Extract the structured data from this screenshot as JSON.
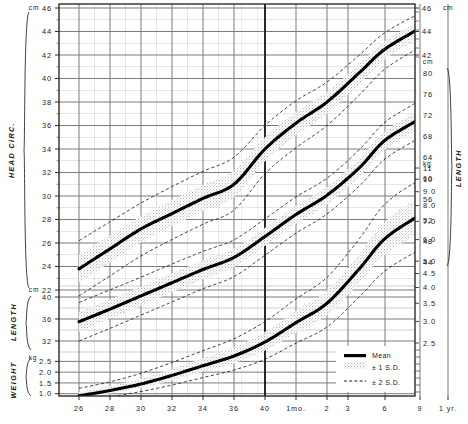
{
  "chart_data": {
    "type": "line",
    "title": "",
    "xlabel": "",
    "ylabel": "",
    "grid": true,
    "legend_position": "bottom-right",
    "x_axis": {
      "name": "gestational-and-postnatal-age",
      "tick_labels": [
        "26",
        "28",
        "30",
        "32",
        "34",
        "36",
        "40",
        "1mo.",
        "2",
        "3",
        "6",
        "9",
        "1 yr."
      ],
      "tick_x": [
        79,
        110,
        141,
        172,
        203,
        234,
        265,
        296,
        327,
        348,
        385,
        420,
        448
      ],
      "birth_divider_x": 190
    },
    "panels": [
      {
        "name": "head-circumference",
        "axis_title": "HEAD CIRC.",
        "unit_left": "cm",
        "unit_right": "cm",
        "left_ticks": [
          "46",
          "44",
          "42",
          "40",
          "38",
          "36",
          "34",
          "32",
          "30",
          "28",
          "26",
          "24",
          "22"
        ],
        "left_tick_values": [
          46,
          44,
          42,
          40,
          38,
          36,
          34,
          32,
          30,
          28,
          26,
          24,
          22
        ],
        "right_ticks": [
          "46",
          "44",
          "42"
        ],
        "right_tick_values": [
          46,
          44,
          42
        ],
        "ylim": [
          22,
          46
        ],
        "mean_label": "Mean",
        "series": [
          {
            "name": "mean",
            "x": [
              26,
              28,
              30,
              32,
              34,
              36,
              40,
              44,
              48,
              56,
              65,
              74,
              82
            ],
            "values": [
              23.8,
              25.5,
              27.2,
              28.5,
              29.8,
              31.0,
              34.0,
              36.2,
              38.0,
              40.5,
              42.5,
              44.3,
              45.9
            ]
          },
          {
            "name": "plus2sd",
            "x": [
              26,
              28,
              30,
              32,
              34,
              36,
              40,
              44,
              48,
              56,
              65,
              74,
              82
            ],
            "values": [
              26.2,
              27.8,
              29.4,
              30.8,
              32.1,
              33.3,
              36.0,
              38.1,
              39.7,
              42.0,
              43.9,
              45.5,
              46.0
            ]
          },
          {
            "name": "minus2sd",
            "x": [
              26,
              28,
              30,
              32,
              34,
              36,
              40,
              44,
              48,
              56,
              65,
              74,
              82
            ],
            "values": [
              21.5,
              23.2,
              24.9,
              26.3,
              27.6,
              28.8,
              31.9,
              34.1,
              36.0,
              38.6,
              40.8,
              42.7,
              44.2
            ]
          }
        ]
      },
      {
        "name": "length",
        "axis_title": "LENGTH",
        "unit_left": "cm",
        "unit_right": "cm",
        "left_ticks": [
          "40",
          "36",
          "32"
        ],
        "left_tick_values": [
          40,
          36,
          32
        ],
        "right_ticks": [
          "80",
          "76",
          "72",
          "68",
          "64",
          "60",
          "56",
          "52",
          "48",
          "44"
        ],
        "right_tick_values": [
          80,
          76,
          72,
          68,
          64,
          60,
          56,
          52,
          48,
          44
        ],
        "ylim_left": [
          30,
          42
        ],
        "ylim_right": [
          44,
          80
        ],
        "series": [
          {
            "name": "mean",
            "x": [
              26,
              28,
              30,
              32,
              34,
              36,
              40,
              44,
              48,
              56,
              65,
              74,
              82
            ],
            "values": [
              35.5,
              37.8,
              40.2,
              42.6,
              45.0,
              47.2,
              51.0,
              55.0,
              58.5,
              63.5,
              68.5,
              72.5,
              76.5
            ]
          },
          {
            "name": "plus2sd",
            "x": [
              26,
              28,
              30,
              32,
              34,
              36,
              40,
              44,
              48,
              56,
              65,
              74,
              82
            ],
            "values": [
              39.0,
              41.3,
              43.6,
              46.0,
              48.3,
              50.4,
              54.2,
              58.2,
              61.6,
              66.8,
              71.8,
              75.8,
              79.8
            ]
          },
          {
            "name": "minus2sd",
            "x": [
              26,
              28,
              30,
              32,
              34,
              36,
              40,
              44,
              48,
              56,
              65,
              74,
              82
            ],
            "values": [
              32.0,
              34.3,
              36.7,
              39.1,
              41.5,
              43.7,
              47.6,
              51.6,
              55.1,
              60.2,
              65.1,
              69.1,
              73.1
            ]
          }
        ]
      },
      {
        "name": "weight",
        "axis_title": "WEIGHT",
        "unit_left": "kg",
        "unit_right": "kg",
        "left_ticks": [
          "2.5",
          "2.0",
          "1.5",
          "1.0"
        ],
        "left_tick_values": [
          2.5,
          2.0,
          1.5,
          1.0
        ],
        "right_ticks": [
          "11",
          "10",
          "9.0",
          "8.0",
          "7.0",
          "6.0",
          "5.0",
          "4.5",
          "4.0",
          "3.5",
          "3.0",
          "2.5"
        ],
        "right_tick_values": [
          11,
          10,
          9.0,
          8.0,
          7.0,
          6.0,
          5.0,
          4.5,
          4.0,
          3.5,
          3.0,
          2.5
        ],
        "ylim": [
          0.8,
          11
        ],
        "series": [
          {
            "name": "mean",
            "x": [
              26,
              28,
              30,
              32,
              34,
              36,
              40,
              44,
              48,
              56,
              65,
              74,
              82
            ],
            "values": [
              0.9,
              1.15,
              1.45,
              1.85,
              2.3,
              2.75,
              3.4,
              4.3,
              5.2,
              6.8,
              8.2,
              9.3,
              10.1
            ]
          },
          {
            "name": "plus2sd",
            "x": [
              26,
              28,
              30,
              32,
              34,
              36,
              40,
              44,
              48,
              56,
              65,
              74,
              82
            ],
            "values": [
              1.25,
              1.55,
              1.95,
              2.45,
              3.0,
              3.55,
              4.35,
              5.4,
              6.4,
              8.2,
              9.8,
              10.9,
              11.0
            ]
          },
          {
            "name": "minus2sd",
            "x": [
              26,
              28,
              30,
              32,
              34,
              36,
              40,
              44,
              48,
              56,
              65,
              74,
              82
            ],
            "values": [
              0.65,
              0.85,
              1.1,
              1.4,
              1.75,
              2.1,
              2.6,
              3.35,
              4.1,
              5.5,
              6.7,
              7.7,
              8.4
            ]
          }
        ]
      }
    ],
    "legend": [
      {
        "key": "mean",
        "label": "Mean",
        "style": "solid-thick"
      },
      {
        "key": "sd1",
        "label": "± 1 S.D.",
        "style": "stipple-band"
      },
      {
        "key": "sd2",
        "label": "± 2 S.D.",
        "style": "dashed"
      }
    ],
    "colors": {
      "curve": "#000000",
      "grid_major": "#7b7b7b",
      "grid_minor": "#9a9a9a",
      "frame": "#333333",
      "band": "#b9b9b9",
      "background": "#ffffff"
    }
  }
}
